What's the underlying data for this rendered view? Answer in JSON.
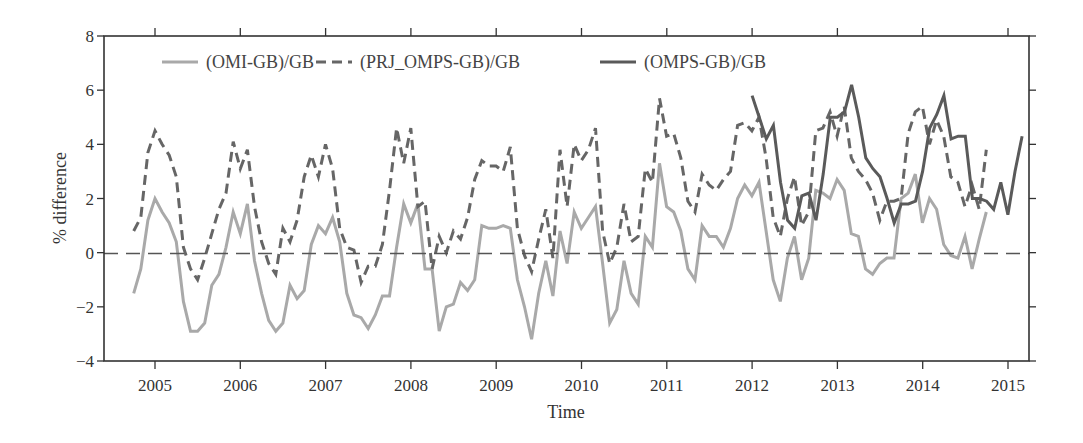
{
  "chart_data": {
    "type": "line",
    "title": "",
    "xlabel": "Time",
    "ylabel": "% difference",
    "xlim": [
      2004.4,
      2015.6
    ],
    "ylim": [
      -4,
      8
    ],
    "x_ticks": [
      "2005",
      "2006",
      "2007",
      "2008",
      "2009",
      "2010",
      "2011",
      "2012",
      "2013",
      "2014",
      "2015"
    ],
    "y_ticks": [
      "−4",
      "−2",
      "0",
      "2",
      "4",
      "6",
      "8"
    ],
    "grid": false,
    "reference_line": {
      "y": 0,
      "style": "dashed"
    },
    "legend_position": "top-inside",
    "series": [
      {
        "name": "(OMI-GB)/GB",
        "style": "solid",
        "color": "#a9a9a9",
        "width": 3,
        "x_start": 2004.75,
        "step": 0.0833,
        "values": [
          -1.5,
          -0.6,
          1.2,
          2.0,
          1.5,
          1.1,
          0.4,
          -1.8,
          -2.9,
          -2.9,
          -2.6,
          -1.2,
          -0.8,
          0.2,
          1.5,
          0.7,
          1.8,
          -0.3,
          -1.5,
          -2.5,
          -2.9,
          -2.6,
          -1.2,
          -1.7,
          -1.4,
          0.3,
          1.0,
          0.7,
          1.3,
          0.4,
          -1.5,
          -2.3,
          -2.4,
          -2.8,
          -2.3,
          -1.6,
          -1.6,
          0.2,
          1.8,
          1.1,
          1.8,
          -0.6,
          -0.6,
          -2.9,
          -2.0,
          -1.9,
          -1.1,
          -1.4,
          -1.0,
          1.0,
          0.9,
          0.9,
          1.0,
          0.9,
          -1.0,
          -2.0,
          -3.2,
          -1.5,
          -0.3,
          -1.6,
          0.8,
          -0.4,
          1.5,
          0.9,
          1.3,
          1.7,
          -0.4,
          -2.6,
          -2.1,
          -0.3,
          -1.5,
          -1.9,
          0.6,
          0.2,
          3.3,
          1.7,
          1.5,
          0.8,
          -0.6,
          -1.0,
          1.0,
          0.6,
          0.6,
          0.2,
          0.9,
          2.0,
          2.5,
          2.1,
          2.6,
          0.8,
          -1.0,
          -1.8,
          -0.2,
          0.6,
          -1.0,
          -0.2,
          2.3,
          2.2,
          2.0,
          2.7,
          2.3,
          0.7,
          0.6,
          -0.6,
          -0.8,
          -0.4,
          -0.2,
          -0.2,
          2.0,
          2.2,
          2.9,
          1.1,
          2.0,
          1.6,
          0.3,
          -0.1,
          -0.2,
          0.6,
          -0.6,
          0.5,
          1.5
        ]
      },
      {
        "name": "(PRJ_OMPS-GB)/GB",
        "style": "dashed",
        "color": "#666666",
        "width": 3,
        "x_start": 2004.75,
        "step": 0.0833,
        "values": [
          0.8,
          1.3,
          3.7,
          4.5,
          4.0,
          3.6,
          2.8,
          0.2,
          -0.6,
          -1.0,
          -0.2,
          0.7,
          1.6,
          2.2,
          4.1,
          3.1,
          3.8,
          1.7,
          0.4,
          -0.4,
          -0.8,
          0.9,
          0.4,
          1.2,
          2.8,
          3.6,
          2.8,
          4.0,
          3.1,
          0.9,
          0.2,
          0.1,
          -1.1,
          -0.5,
          -0.5,
          0.3,
          2.3,
          4.6,
          3.3,
          4.6,
          1.7,
          1.9,
          -0.6,
          0.6,
          0.0,
          0.8,
          0.5,
          1.3,
          2.7,
          3.4,
          3.2,
          3.2,
          3.0,
          3.9,
          0.9,
          -0.1,
          -0.7,
          0.5,
          1.6,
          -0.2,
          3.8,
          1.7,
          4.0,
          3.4,
          3.8,
          4.6,
          0.8,
          -0.4,
          0.2,
          1.8,
          0.4,
          0.6,
          3.1,
          2.6,
          5.7,
          4.3,
          4.4,
          3.5,
          1.9,
          1.5,
          2.9,
          2.5,
          2.3,
          2.7,
          3.0,
          4.7,
          4.8,
          4.5,
          5.0,
          3.5,
          1.3,
          0.6,
          2.0,
          2.8,
          1.0,
          1.5,
          4.5,
          4.6,
          5.2,
          4.3,
          5.4,
          3.5,
          3.0,
          2.7,
          2.2,
          1.2,
          1.9,
          1.9,
          2.0,
          4.4,
          5.2,
          5.4,
          4.0,
          4.9,
          4.3,
          2.8,
          2.6,
          1.7,
          2.5,
          1.6,
          3.8
        ]
      },
      {
        "name": "(OMPS-GB)/GB",
        "style": "solid",
        "color": "#5a5a5a",
        "width": 3,
        "x_start": 2012.0,
        "step": 0.0833,
        "values": [
          5.8,
          5.0,
          4.2,
          4.7,
          2.6,
          1.2,
          0.9,
          2.1,
          2.2,
          1.2,
          2.9,
          5.0,
          5.0,
          5.2,
          6.2,
          5.0,
          3.5,
          3.1,
          2.8,
          2.0,
          1.1,
          1.8,
          1.8,
          1.9,
          3.0,
          4.6,
          5.1,
          5.8,
          4.2,
          4.3,
          4.3,
          2.0,
          2.0,
          1.9,
          1.6,
          2.6,
          1.4,
          3.0,
          4.3
        ]
      }
    ]
  },
  "legend": {
    "items": [
      {
        "label": "(OMI-GB)/GB"
      },
      {
        "label": "(PRJ_OMPS-GB)/GB"
      },
      {
        "label": "(OMPS-GB)/GB"
      }
    ]
  },
  "axes": {
    "xlabel": "Time",
    "ylabel": "% difference"
  }
}
